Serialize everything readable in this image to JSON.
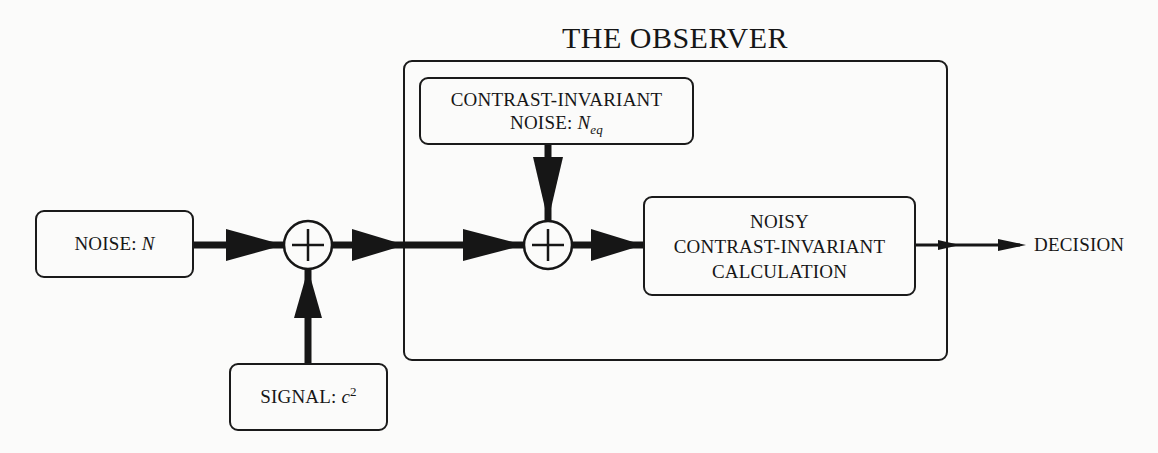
{
  "diagram": {
    "title": "THE OBSERVER",
    "blocks": {
      "noise": {
        "label": "NOISE: ",
        "symbol": "N"
      },
      "signal": {
        "label": "SIGNAL: ",
        "symbol": "c",
        "superscript": "2"
      },
      "cn_noise": {
        "line1": "CONTRAST-INVARIANT",
        "line2_label": "NOISE: ",
        "symbol": "N",
        "subscript": "eq"
      },
      "calculation": {
        "line1": "NOISY",
        "line2": "CONTRAST-INVARIANT",
        "line3": "CALCULATION"
      }
    },
    "summing_junctions": [
      {
        "id": "sum-1",
        "symbol": "+",
        "inputs": [
          "NOISE: N",
          "SIGNAL: c2"
        ]
      },
      {
        "id": "sum-2",
        "symbol": "+",
        "inputs": [
          "sum-1 output",
          "CONTRAST-INVARIANT NOISE: Neq"
        ]
      }
    ],
    "output": {
      "label": "DECISION"
    },
    "edges": [
      {
        "from": "NOISE: N",
        "to": "sum-1",
        "style": "thick"
      },
      {
        "from": "SIGNAL: c2",
        "to": "sum-1",
        "style": "thick"
      },
      {
        "from": "sum-1",
        "to": "sum-2",
        "style": "thick"
      },
      {
        "from": "CONTRAST-INVARIANT NOISE: Neq",
        "to": "sum-2",
        "style": "thick"
      },
      {
        "from": "sum-2",
        "to": "NOISY CONTRAST-INVARIANT CALCULATION",
        "style": "thick"
      },
      {
        "from": "NOISY CONTRAST-INVARIANT CALCULATION",
        "to": "DECISION",
        "style": "thin"
      }
    ],
    "colors": {
      "ink": "#161616",
      "paper": "#fbfbfa"
    }
  }
}
